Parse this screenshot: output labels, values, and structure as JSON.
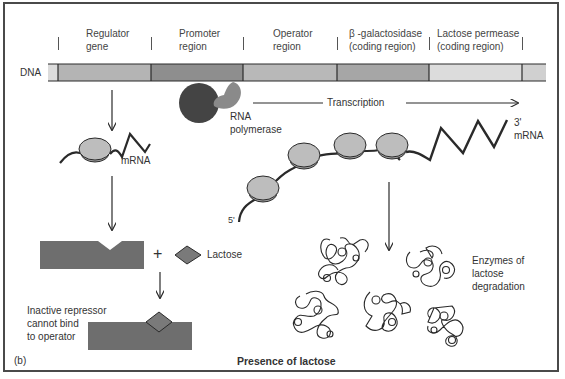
{
  "figure": {
    "panel_label": "(b)",
    "caption": "Presence of lactose",
    "dna_label": "DNA",
    "regions": [
      {
        "line1": "Regulator",
        "line2": "gene",
        "color": "#b4b4b4"
      },
      {
        "line1": "Promoter",
        "line2": "region",
        "color": "#8e8e8e"
      },
      {
        "line1": "Operator",
        "line2": "region",
        "color": "#b8b8b8"
      },
      {
        "line1": "β -galactosidase",
        "line2": "(coding region)",
        "color": "#a6a6a6"
      },
      {
        "line1": "Lactose permease",
        "line2": "(coding region)",
        "color": "#dcdcdc"
      }
    ],
    "rna_polymerase": {
      "line1": "RNA",
      "line2": "polymerase"
    },
    "transcription_label": "Transcription",
    "left_mrna_label": "mRNA",
    "right_mrna": {
      "end_3": "3'",
      "label": "mRNA",
      "end_5": "5'"
    },
    "plus_sign": "+",
    "lactose_label": "Lactose",
    "inactive_repressor": {
      "line1": "Inactive repressor",
      "line2": "cannot bind",
      "line3": "to operator"
    },
    "enzymes": {
      "line1": "Enzymes of",
      "line2": "lactose",
      "line3": "degradation"
    },
    "colors": {
      "outline": "#2a2a2a",
      "repressor": "#6e6e6e",
      "lactose": "#7a7a7a",
      "ribosome": "#bdbdbd",
      "polymerase_dark": "#444444",
      "polymerase_light": "#8a8a8a"
    }
  }
}
